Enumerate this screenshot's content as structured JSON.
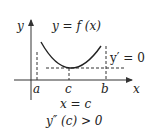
{
  "diagram": {
    "function_label": "y = f (x)",
    "y_axis_label": "y",
    "x_axis_label": "x",
    "point_labels": {
      "a": "a",
      "c": "c",
      "b": "b"
    },
    "tangent_label": "y′ = 0",
    "condition_line1": "x = c",
    "condition_line2": "y″ (c) > 0",
    "colors": {
      "stroke": "#222222",
      "axis": "#444444",
      "background": "#ffffff"
    }
  }
}
